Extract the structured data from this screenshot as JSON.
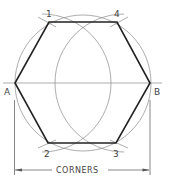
{
  "diagram": {
    "labels": {
      "p1": "1",
      "p2": "2",
      "p3": "3",
      "p4": "4",
      "a": "A",
      "b": "B"
    },
    "dimension_label": "CORNERS",
    "colors": {
      "hexagon": "#222222",
      "construction": "#8a8a8a",
      "text": "#444444"
    }
  }
}
